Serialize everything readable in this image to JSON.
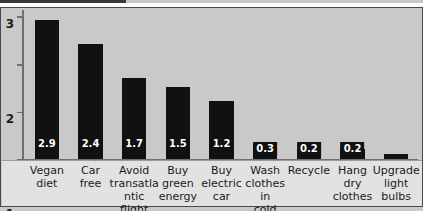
{
  "chart_data": {
    "type": "bar",
    "title": "",
    "subtitle": "",
    "xlabel": "",
    "ylabel": "",
    "ylim": [
      0,
      3.15
    ],
    "y_ticks": [
      "0",
      "1",
      "2",
      "3"
    ],
    "y_tick_values": [
      0,
      1,
      2,
      3
    ],
    "grid": false,
    "legend": "none",
    "categories": [
      "Vegan diet",
      "Car free",
      "Avoid transatlantic flight",
      "Buy green energy",
      "Buy electric car",
      "Wash clothes in cold water",
      "Recycle",
      "Hang dry clothes",
      "Upgrade light bulbs"
    ],
    "category_lines": [
      [
        "Vegan",
        "diet"
      ],
      [
        "Car",
        "free"
      ],
      [
        "Avoid",
        "transatlantic",
        "flight"
      ],
      [
        "Buy",
        "green",
        "energy"
      ],
      [
        "Buy",
        "electric",
        "car"
      ],
      [
        "Wash",
        "clothes in",
        "cold water"
      ],
      [
        "Recycle"
      ],
      [
        "Hang",
        "dry",
        "clothes"
      ],
      [
        "Upgrade",
        "light",
        "bulbs"
      ]
    ],
    "values": [
      2.9,
      2.4,
      1.7,
      1.5,
      1.2,
      0.3,
      0.2,
      0.2,
      0.1
    ],
    "value_labels": [
      "2.9",
      "2.4",
      "1.7",
      "1.5",
      "1.2",
      "0.3",
      "0.2",
      "0.2",
      ""
    ],
    "bar_color": "#111111",
    "value_label_color": "#ffffff",
    "plot_background": "#c9c9c9",
    "label_band_background": "#e2e2e2",
    "axis_color": "#6f6f6f"
  }
}
